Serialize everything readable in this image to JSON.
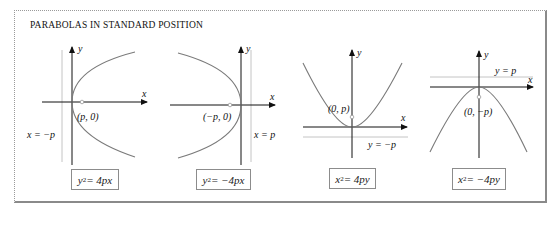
{
  "title": "PARABOLAS IN STANDARD POSITION",
  "colors": {
    "axis": "#111111",
    "curve": "#7a7a7a",
    "directrix": "#b0b0b0",
    "focus": "#a0a0a0",
    "frame": "#8a8a8a"
  },
  "graphs": [
    {
      "id": "right-opening",
      "axis_x_label": "x",
      "axis_y_label": "y",
      "focus_label": "(p, 0)",
      "directrix_label": "x = −p",
      "equation": {
        "lhs_var": "y",
        "exp": "2",
        "rhs": " = 4px"
      }
    },
    {
      "id": "left-opening",
      "axis_x_label": "x",
      "axis_y_label": "y",
      "focus_label": "(−p, 0)",
      "directrix_label": "x = p",
      "equation": {
        "lhs_var": "y",
        "exp": "2",
        "rhs": " = −4px"
      }
    },
    {
      "id": "up-opening",
      "axis_x_label": "x",
      "axis_y_label": "y",
      "focus_label": "(0, p)",
      "directrix_label": "y = −p",
      "equation": {
        "lhs_var": "x",
        "exp": "2",
        "rhs": " = 4py"
      }
    },
    {
      "id": "down-opening",
      "axis_x_label": "x",
      "axis_y_label": "y",
      "focus_label": "(0, −p)",
      "directrix_label": "y = p",
      "equation": {
        "lhs_var": "x",
        "exp": "2",
        "rhs": " = −4py"
      }
    }
  ]
}
